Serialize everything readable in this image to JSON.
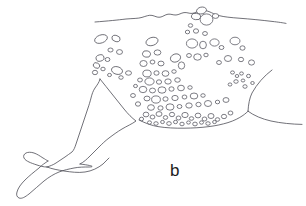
{
  "figure": {
    "panel_label": "b",
    "label_position": {
      "x": 170,
      "y": 162
    },
    "caption_text": "",
    "background_color": "#ffffff",
    "line_color": "#4d4d55",
    "barnacle_stroke_color": "#53535c",
    "barnacle_fill_color": "#ffffff",
    "label_color": "#1d1d22",
    "canvas": {
      "width": 306,
      "height": 206
    },
    "outlines": [
      {
        "name": "dorsal-contour",
        "path": "M 95,22 C 108,21 118,20 126,19 C 133,18.4 138,18.6 142,17.4 C 146,16.2 149,14.8 152,15.4 C 155,16 157,17.6 160,17.2 C 163,16.8 165,14.6 168,14.2 C 171,13.8 173,15.2 176,15.0 C 179,14.8 181,13.0 184,12.6 C 187,12.2 189,13.6 192,13.4 C 195,13.2 197,11.4 200,10.6 C 203,9.8 206,10.4 209,11.6 C 212,12.8 215,14.6 219,15.6 C 224,16.9 231,17.6 239,18.2 C 250,19.0 262,20.2 272,21.4 C 279,22.2 283,22.8 286,23.4"
      },
      {
        "name": "ventral-contour",
        "path": "M 139,120 C 146,123.5 152,125.6 158,126.6 C 166,127.9 175,128.3 184,128.2 C 193,128.1 201,127.6 209,126.6 C 216,125.7 222,124.4 228,122.6 C 234,120.7 239,118.2 243,115.4 C 245.6,113.6 247,112.2 248,111.2"
      },
      {
        "name": "peduncle-upper-curve",
        "path": "M 272,70 C 264,76 257,84 252,93 C 249.6,98 248.4,104 248,111.2"
      },
      {
        "name": "peduncle-lower-curve",
        "path": "M 248,111.2 C 254,115.6 262,119 271,121 C 281,123.2 292,124.2 302,124.4"
      },
      {
        "name": "flipper-leading-edge",
        "path": "M 100,79 C 99,83 97,85 95,88 C 93,91 92,94 91,98 C 90,102 89,105 88,108 C 87,111 86,114 85,117 C 84,120 83,123 82,126 C 81,129 80,132 79,135 C 78,138 77,141 76,144 C 75,147 74,150 72,152 C 70,154 67,155 65,157 C 62,159 59,161 56,163 C 53,165 50,166 47,167"
      },
      {
        "name": "flipper-trailing-edge",
        "path": "M 100,79 C 104,84 108,89 112,94 C 116,99 120,104 124,109 C 128,114 132,118 136,121 C 132,124 127,126 122,129 C 117,132 113,135 109,138 C 105,141 102,144 99,147 C 96,150 93,153 90,156 C 87,159 84,162 80,164"
      },
      {
        "name": "flipper-tip-lobe-upper",
        "path": "M 47,167 C 43,167 40,166 37,165 C 34,164 31,163 29,162 C 27,161 25,160 24,158 C 23,156 24,154 26,153 C 28,152 31,152 34,153 C 37,154 40,156 43,158 C 45,159 46,160 48,161"
      },
      {
        "name": "flipper-tip-lobe-lower",
        "path": "M 48,161 C 45,163 42,165 39,168 C 34,172 29,176 25,180 C 21,184 18,188 17,192 C 16,195 17,197 19,198 C 22,199 25,197 29,194 C 34,190 39,185 44,181 C 49,177 54,174 59,172 C 64,170 69,169 74,168 C 79,167 84,167 89,167 C 93,167 96,166 80,164"
      },
      {
        "name": "flipper-ventral-edge",
        "path": "M 47,167 C 52,169 58,170 64,171 C 71,172 78,173 85,172 C 92,171 98,168 103,164 C 105,162 107,160 109,158"
      }
    ],
    "barnacle_clusters": [
      {
        "name": "dorsal-ridge-cluster",
        "count": 5
      },
      {
        "name": "upper-left-cluster",
        "count": 13
      },
      {
        "name": "central-field",
        "count": 34
      },
      {
        "name": "upper-right-cluster",
        "count": 14
      },
      {
        "name": "right-small-cluster",
        "count": 9
      },
      {
        "name": "ventral-dense-row",
        "count": 26
      }
    ],
    "barnacles": [
      {
        "cx": 201.5,
        "cy": 10.5,
        "rx": 5.0,
        "ry": 3.4,
        "rot": -12
      },
      {
        "cx": 196.0,
        "cy": 16.5,
        "rx": 4.6,
        "ry": 3.2,
        "rot": 10
      },
      {
        "cx": 206.5,
        "cy": 19.5,
        "rx": 6.4,
        "ry": 5.6,
        "rot": 0
      },
      {
        "cx": 215.5,
        "cy": 16.0,
        "rx": 3.2,
        "ry": 2.4,
        "rot": 0
      },
      {
        "cx": 190.5,
        "cy": 25.5,
        "rx": 2.2,
        "ry": 1.8,
        "rot": 0
      },
      {
        "cx": 101.0,
        "cy": 39.0,
        "rx": 6.6,
        "ry": 4.0,
        "rot": -20
      },
      {
        "cx": 116.0,
        "cy": 38.5,
        "rx": 4.2,
        "ry": 3.0,
        "rot": 18
      },
      {
        "cx": 110.5,
        "cy": 50.0,
        "rx": 2.6,
        "ry": 2.0,
        "rot": 0
      },
      {
        "cx": 119.5,
        "cy": 52.0,
        "rx": 3.0,
        "ry": 2.4,
        "rot": 0
      },
      {
        "cx": 100.0,
        "cy": 58.0,
        "rx": 4.0,
        "ry": 3.2,
        "rot": -15
      },
      {
        "cx": 107.5,
        "cy": 59.5,
        "rx": 2.4,
        "ry": 2.0,
        "rot": 0
      },
      {
        "cx": 96.5,
        "cy": 65.5,
        "rx": 3.4,
        "ry": 2.6,
        "rot": 25
      },
      {
        "cx": 103.0,
        "cy": 69.0,
        "rx": 2.2,
        "ry": 1.8,
        "rot": 0
      },
      {
        "cx": 95.0,
        "cy": 72.5,
        "rx": 2.6,
        "ry": 2.2,
        "rot": 0
      },
      {
        "cx": 117.0,
        "cy": 70.5,
        "rx": 5.6,
        "ry": 3.8,
        "rot": 15
      },
      {
        "cx": 109.5,
        "cy": 75.0,
        "rx": 2.0,
        "ry": 1.6,
        "rot": 0
      },
      {
        "cx": 121.0,
        "cy": 77.5,
        "rx": 2.2,
        "ry": 1.8,
        "rot": 0
      },
      {
        "cx": 128.5,
        "cy": 73.0,
        "rx": 3.0,
        "ry": 2.2,
        "rot": 0
      },
      {
        "cx": 152.0,
        "cy": 41.5,
        "rx": 6.2,
        "ry": 4.0,
        "rot": -18
      },
      {
        "cx": 146.5,
        "cy": 54.0,
        "rx": 4.0,
        "ry": 3.2,
        "rot": 12
      },
      {
        "cx": 157.5,
        "cy": 52.5,
        "rx": 3.4,
        "ry": 2.6,
        "rot": 0
      },
      {
        "cx": 143.5,
        "cy": 63.5,
        "rx": 3.6,
        "ry": 3.0,
        "rot": 0
      },
      {
        "cx": 152.5,
        "cy": 62.0,
        "rx": 2.4,
        "ry": 2.0,
        "rot": 0
      },
      {
        "cx": 161.0,
        "cy": 63.5,
        "rx": 3.0,
        "ry": 2.4,
        "rot": 0
      },
      {
        "cx": 147.0,
        "cy": 73.5,
        "rx": 4.2,
        "ry": 3.4,
        "rot": 0
      },
      {
        "cx": 156.5,
        "cy": 73.0,
        "rx": 2.6,
        "ry": 2.2,
        "rot": 0
      },
      {
        "cx": 165.5,
        "cy": 73.5,
        "rx": 3.4,
        "ry": 2.8,
        "rot": 0
      },
      {
        "cx": 174.0,
        "cy": 71.5,
        "rx": 2.2,
        "ry": 1.8,
        "rot": 0
      },
      {
        "cx": 140.0,
        "cy": 80.0,
        "rx": 2.4,
        "ry": 2.0,
        "rot": 0
      },
      {
        "cx": 149.5,
        "cy": 81.5,
        "rx": 4.6,
        "ry": 3.6,
        "rot": 0
      },
      {
        "cx": 159.0,
        "cy": 82.0,
        "rx": 2.6,
        "ry": 2.2,
        "rot": 0
      },
      {
        "cx": 168.0,
        "cy": 81.5,
        "rx": 3.2,
        "ry": 2.6,
        "rot": 0
      },
      {
        "cx": 177.5,
        "cy": 80.0,
        "rx": 2.8,
        "ry": 2.2,
        "rot": 0
      },
      {
        "cx": 143.0,
        "cy": 89.5,
        "rx": 3.8,
        "ry": 3.2,
        "rot": 0
      },
      {
        "cx": 152.5,
        "cy": 90.5,
        "rx": 3.0,
        "ry": 2.4,
        "rot": 0
      },
      {
        "cx": 162.0,
        "cy": 90.0,
        "rx": 4.0,
        "ry": 3.2,
        "rot": 0
      },
      {
        "cx": 171.5,
        "cy": 89.0,
        "rx": 2.6,
        "ry": 2.2,
        "rot": 0
      },
      {
        "cx": 181.0,
        "cy": 88.0,
        "rx": 3.4,
        "ry": 2.8,
        "rot": 0
      },
      {
        "cx": 190.0,
        "cy": 87.5,
        "rx": 2.2,
        "ry": 1.8,
        "rot": 0
      },
      {
        "cx": 147.0,
        "cy": 98.5,
        "rx": 3.0,
        "ry": 2.4,
        "rot": 0
      },
      {
        "cx": 156.0,
        "cy": 99.5,
        "rx": 4.4,
        "ry": 3.6,
        "rot": 0
      },
      {
        "cx": 165.5,
        "cy": 99.0,
        "rx": 2.6,
        "ry": 2.2,
        "rot": 0
      },
      {
        "cx": 175.0,
        "cy": 98.0,
        "rx": 3.2,
        "ry": 2.6,
        "rot": 0
      },
      {
        "cx": 184.5,
        "cy": 97.0,
        "rx": 2.4,
        "ry": 2.0,
        "rot": 0
      },
      {
        "cx": 194.0,
        "cy": 96.0,
        "rx": 3.8,
        "ry": 3.0,
        "rot": 0
      },
      {
        "cx": 203.0,
        "cy": 95.5,
        "rx": 2.2,
        "ry": 1.8,
        "rot": 0
      },
      {
        "cx": 151.0,
        "cy": 107.5,
        "rx": 3.4,
        "ry": 2.8,
        "rot": 0
      },
      {
        "cx": 160.5,
        "cy": 108.0,
        "rx": 2.6,
        "ry": 2.2,
        "rot": 0
      },
      {
        "cx": 170.0,
        "cy": 107.0,
        "rx": 4.0,
        "ry": 3.2,
        "rot": 0
      },
      {
        "cx": 179.5,
        "cy": 106.5,
        "rx": 2.4,
        "ry": 2.0,
        "rot": 0
      },
      {
        "cx": 189.0,
        "cy": 105.5,
        "rx": 3.2,
        "ry": 2.6,
        "rot": 0
      },
      {
        "cx": 198.5,
        "cy": 104.5,
        "rx": 2.6,
        "ry": 2.2,
        "rot": 0
      },
      {
        "cx": 208.0,
        "cy": 103.5,
        "rx": 3.6,
        "ry": 3.0,
        "rot": 0
      },
      {
        "cx": 217.5,
        "cy": 102.0,
        "rx": 2.2,
        "ry": 1.8,
        "rot": 0
      },
      {
        "cx": 226.0,
        "cy": 100.0,
        "rx": 3.0,
        "ry": 2.4,
        "rot": 0
      },
      {
        "cx": 135.5,
        "cy": 86.0,
        "rx": 2.0,
        "ry": 1.6,
        "rot": 0
      },
      {
        "cx": 133.0,
        "cy": 95.5,
        "rx": 2.4,
        "ry": 2.0,
        "rot": 0
      },
      {
        "cx": 138.0,
        "cy": 104.0,
        "rx": 2.6,
        "ry": 2.2,
        "rot": 0
      },
      {
        "cx": 187.5,
        "cy": 32.0,
        "rx": 2.2,
        "ry": 1.8,
        "rot": 0
      },
      {
        "cx": 196.0,
        "cy": 31.0,
        "rx": 2.6,
        "ry": 2.2,
        "rot": 0
      },
      {
        "cx": 205.0,
        "cy": 33.5,
        "rx": 2.4,
        "ry": 2.0,
        "rot": 0
      },
      {
        "cx": 192.0,
        "cy": 43.5,
        "rx": 5.6,
        "ry": 4.6,
        "rot": 0
      },
      {
        "cx": 203.0,
        "cy": 45.0,
        "rx": 3.4,
        "ry": 3.8,
        "rot": 0
      },
      {
        "cx": 214.5,
        "cy": 42.5,
        "rx": 4.6,
        "ry": 3.6,
        "rot": 0
      },
      {
        "cx": 221.5,
        "cy": 47.5,
        "rx": 2.4,
        "ry": 2.0,
        "rot": 0
      },
      {
        "cx": 235.0,
        "cy": 41.0,
        "rx": 5.0,
        "ry": 3.8,
        "rot": 0
      },
      {
        "cx": 242.5,
        "cy": 48.0,
        "rx": 2.6,
        "ry": 2.2,
        "rot": 0
      },
      {
        "cx": 189.0,
        "cy": 55.5,
        "rx": 2.4,
        "ry": 2.0,
        "rot": 0
      },
      {
        "cx": 197.5,
        "cy": 57.0,
        "rx": 3.8,
        "ry": 3.2,
        "rot": 0
      },
      {
        "cx": 206.0,
        "cy": 55.0,
        "rx": 2.2,
        "ry": 1.8,
        "rot": 0
      },
      {
        "cx": 228.0,
        "cy": 58.5,
        "rx": 3.6,
        "ry": 3.0,
        "rot": 0
      },
      {
        "cx": 219.0,
        "cy": 62.5,
        "rx": 2.4,
        "ry": 2.0,
        "rot": 0
      },
      {
        "cx": 241.0,
        "cy": 59.5,
        "rx": 2.6,
        "ry": 2.2,
        "rot": 0
      },
      {
        "cx": 251.5,
        "cy": 62.5,
        "rx": 3.0,
        "ry": 2.6,
        "rot": 0
      },
      {
        "cx": 175.5,
        "cy": 58.0,
        "rx": 5.2,
        "ry": 4.0,
        "rot": -20
      },
      {
        "cx": 181.5,
        "cy": 65.5,
        "rx": 3.2,
        "ry": 3.6,
        "rot": 0
      },
      {
        "cx": 232.5,
        "cy": 72.5,
        "rx": 2.0,
        "ry": 1.6,
        "rot": 0
      },
      {
        "cx": 237.0,
        "cy": 76.0,
        "rx": 1.8,
        "ry": 1.5,
        "rot": 0
      },
      {
        "cx": 241.5,
        "cy": 73.5,
        "rx": 1.9,
        "ry": 1.6,
        "rot": 0
      },
      {
        "cx": 236.0,
        "cy": 81.5,
        "rx": 2.2,
        "ry": 1.8,
        "rot": 0
      },
      {
        "cx": 243.0,
        "cy": 80.5,
        "rx": 1.8,
        "ry": 1.5,
        "rot": 0
      },
      {
        "cx": 248.5,
        "cy": 76.0,
        "rx": 2.0,
        "ry": 1.7,
        "rot": 0
      },
      {
        "cx": 230.0,
        "cy": 84.5,
        "rx": 1.9,
        "ry": 1.6,
        "rot": 0
      },
      {
        "cx": 245.0,
        "cy": 86.5,
        "rx": 2.1,
        "ry": 1.8,
        "rot": 0
      },
      {
        "cx": 252.5,
        "cy": 83.0,
        "rx": 1.8,
        "ry": 1.5,
        "rot": 0
      },
      {
        "cx": 146.0,
        "cy": 114.5,
        "rx": 2.8,
        "ry": 2.4,
        "rot": 0
      },
      {
        "cx": 152.5,
        "cy": 117.0,
        "rx": 2.4,
        "ry": 2.0,
        "rot": 0
      },
      {
        "cx": 159.0,
        "cy": 114.0,
        "rx": 3.0,
        "ry": 2.4,
        "rot": 0
      },
      {
        "cx": 165.5,
        "cy": 117.5,
        "rx": 2.2,
        "ry": 1.9,
        "rot": 0
      },
      {
        "cx": 172.0,
        "cy": 114.5,
        "rx": 2.6,
        "ry": 2.2,
        "rot": 0
      },
      {
        "cx": 178.5,
        "cy": 118.0,
        "rx": 2.4,
        "ry": 2.0,
        "rot": 0
      },
      {
        "cx": 185.0,
        "cy": 115.0,
        "rx": 3.2,
        "ry": 2.6,
        "rot": 0
      },
      {
        "cx": 191.5,
        "cy": 118.5,
        "rx": 2.2,
        "ry": 1.8,
        "rot": 0
      },
      {
        "cx": 198.0,
        "cy": 115.5,
        "rx": 2.8,
        "ry": 2.4,
        "rot": 0
      },
      {
        "cx": 204.5,
        "cy": 119.0,
        "rx": 2.4,
        "ry": 2.0,
        "rot": 0
      },
      {
        "cx": 211.0,
        "cy": 116.0,
        "rx": 3.0,
        "ry": 2.5,
        "rot": 0
      },
      {
        "cx": 217.5,
        "cy": 119.5,
        "rx": 2.2,
        "ry": 1.8,
        "rot": 0
      },
      {
        "cx": 224.0,
        "cy": 116.5,
        "rx": 2.6,
        "ry": 2.2,
        "rot": 0
      },
      {
        "cx": 149.5,
        "cy": 122.5,
        "rx": 2.0,
        "ry": 1.7,
        "rot": 0
      },
      {
        "cx": 156.0,
        "cy": 123.5,
        "rx": 2.2,
        "ry": 1.8,
        "rot": 0
      },
      {
        "cx": 162.5,
        "cy": 122.0,
        "rx": 1.9,
        "ry": 1.6,
        "rot": 0
      },
      {
        "cx": 169.0,
        "cy": 123.5,
        "rx": 2.3,
        "ry": 1.9,
        "rot": 0
      },
      {
        "cx": 175.5,
        "cy": 122.0,
        "rx": 2.0,
        "ry": 1.7,
        "rot": 0
      },
      {
        "cx": 182.0,
        "cy": 124.0,
        "rx": 2.2,
        "ry": 1.8,
        "rot": 0
      },
      {
        "cx": 188.5,
        "cy": 122.5,
        "rx": 1.9,
        "ry": 1.6,
        "rot": 0
      },
      {
        "cx": 195.0,
        "cy": 124.0,
        "rx": 2.3,
        "ry": 1.9,
        "rot": 0
      },
      {
        "cx": 201.5,
        "cy": 122.5,
        "rx": 2.0,
        "ry": 1.7,
        "rot": 0
      },
      {
        "cx": 208.0,
        "cy": 123.5,
        "rx": 2.2,
        "ry": 1.8,
        "rot": 0
      },
      {
        "cx": 214.5,
        "cy": 122.0,
        "rx": 1.9,
        "ry": 1.6,
        "rot": 0
      },
      {
        "cx": 141.5,
        "cy": 119.0,
        "rx": 2.1,
        "ry": 1.8,
        "rot": 0
      },
      {
        "cx": 230.5,
        "cy": 113.0,
        "rx": 2.4,
        "ry": 2.0,
        "rot": 0
      }
    ]
  }
}
